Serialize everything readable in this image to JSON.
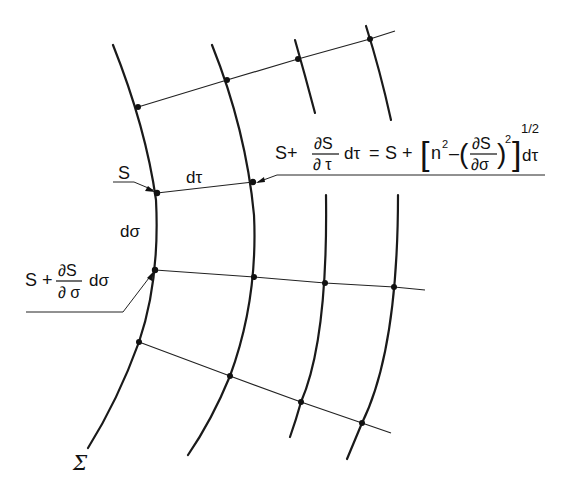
{
  "figure": {
    "type": "wavefront-ray grid diagram",
    "labels": {
      "sigma_surface": "Σ",
      "point_S": "S",
      "d_tau": "dτ",
      "d_sigma": "dσ",
      "lower_left_formula": {
        "prefix": "S +",
        "numerator": "∂S",
        "denominator": "∂ σ",
        "suffix": "dσ"
      },
      "right_formula": {
        "lhs_prefix": "S+",
        "lhs_numerator": "∂S",
        "lhs_denominator": "∂ τ",
        "lhs_suffix": "dτ",
        "equals": "=",
        "rhs_prefix": "S +",
        "bracket_open": "[",
        "n_squared": "n",
        "n_exponent": "2",
        "minus": "–",
        "paren_open": "(",
        "inner_numerator": "∂S",
        "inner_denominator": "∂σ",
        "paren_close": ")",
        "inner_exponent": "2",
        "bracket_close": "]",
        "outer_exponent": "1/2",
        "rhs_suffix": "dτ"
      }
    },
    "colors": {
      "line": "#1a1a1a",
      "background": "#ffffff"
    }
  }
}
